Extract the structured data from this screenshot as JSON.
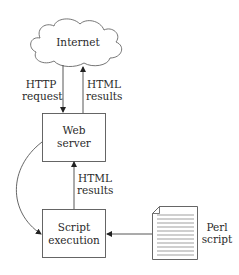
{
  "nodes": {
    "internet": {
      "label": "Internet"
    },
    "web_server": {
      "line1": "Web",
      "line2": "server"
    },
    "script_execution": {
      "line1": "Script",
      "line2": "execution"
    },
    "perl_script": {
      "line1": "Perl",
      "line2": "script"
    }
  },
  "edges": {
    "http_request": {
      "line1": "HTTP",
      "line2": "request"
    },
    "html_results_top": {
      "line1": "HTML",
      "line2": "results"
    },
    "html_results_middle": {
      "line1": "HTML",
      "line2": "results"
    }
  },
  "colors": {
    "stroke": "#555555",
    "text": "#2a2a2a",
    "background": "#ffffff"
  }
}
